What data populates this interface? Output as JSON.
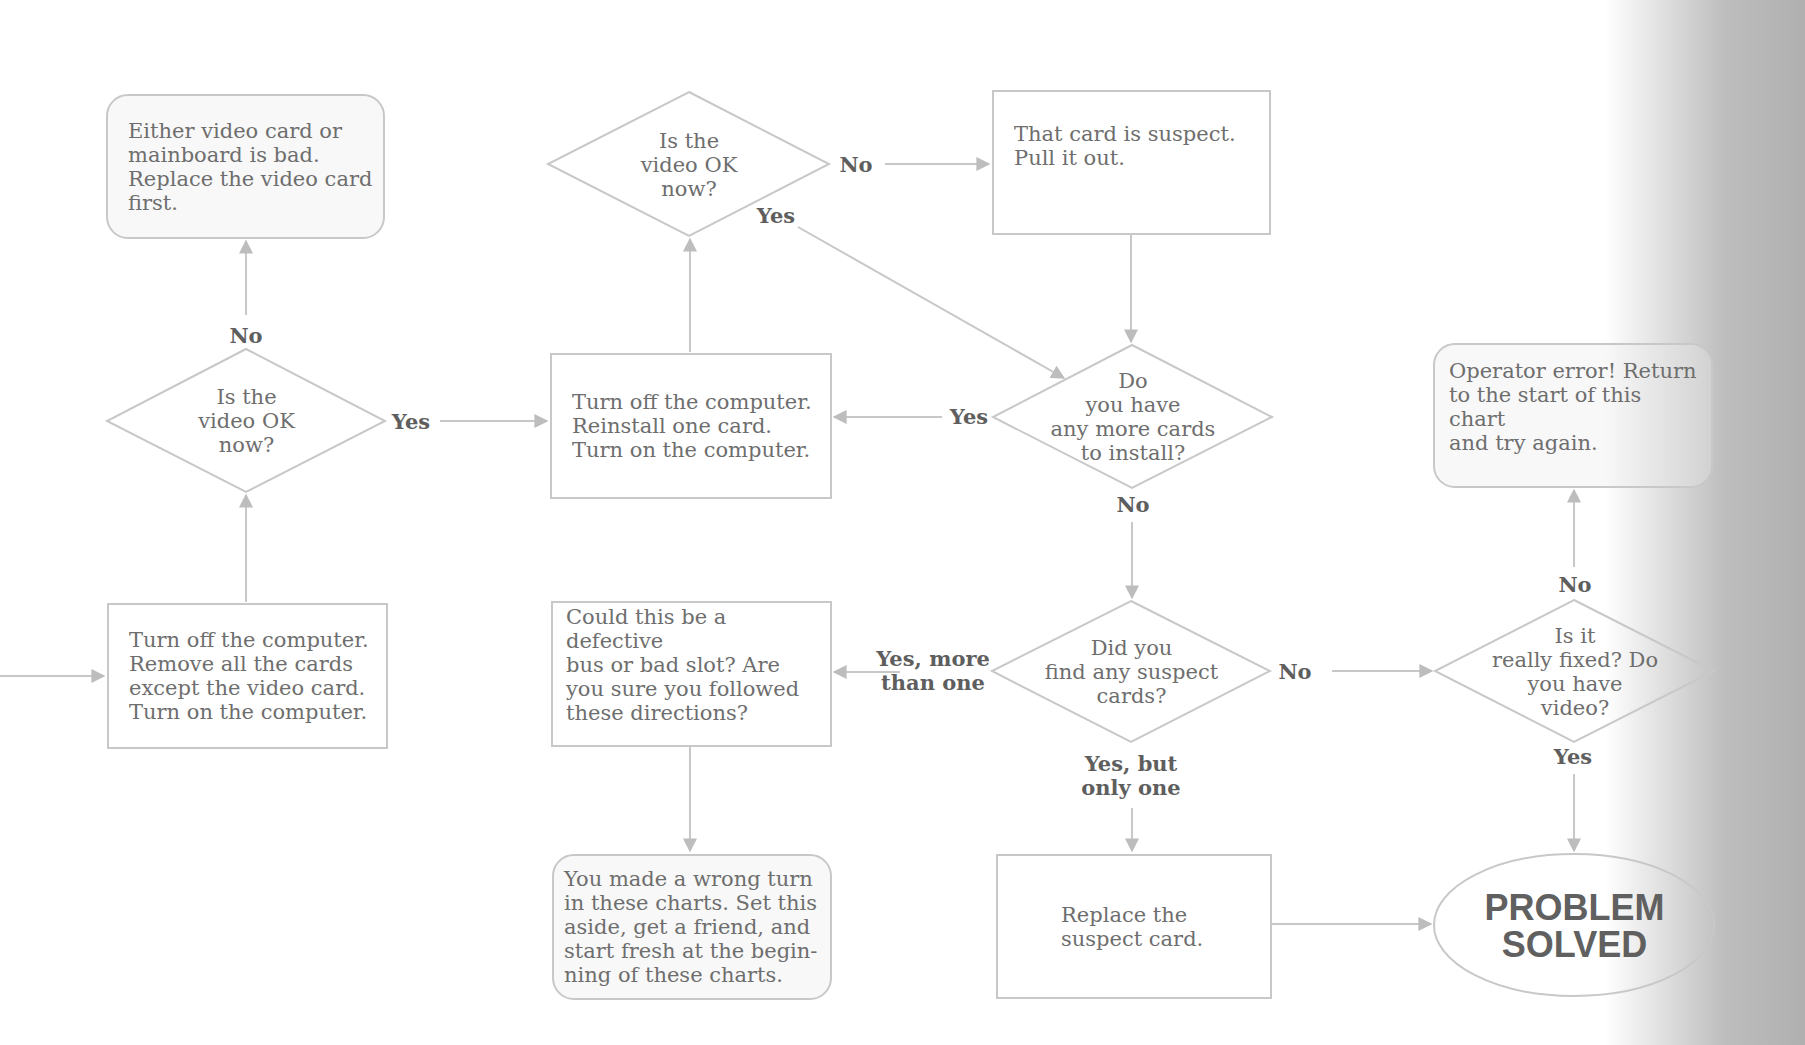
{
  "theme": {
    "line_color": "#c8c8c8",
    "arrow_color": "#bdbdbd",
    "text_color": "#6e6e6e",
    "label_color": "#5e5e5e"
  },
  "nodes": {
    "replace_video_card": {
      "type": "terminal-rounded",
      "text": "Either video card or\nmainboard is bad.\nReplace the video card\nfirst."
    },
    "video_ok_top": {
      "type": "decision",
      "text": "Is the\nvideo OK\nnow?"
    },
    "card_suspect": {
      "type": "process",
      "text": "That card is suspect.\nPull it out."
    },
    "video_ok_left": {
      "type": "decision",
      "text": "Is the\nvideo OK\nnow?"
    },
    "reinstall_card": {
      "type": "process",
      "text": "Turn off the computer.\nReinstall one card.\nTurn on the computer."
    },
    "more_cards": {
      "type": "decision",
      "text": "Do\nyou have\nany more cards\nto install?"
    },
    "operator_error": {
      "type": "terminal-rounded",
      "text": "Operator error!  Return\nto the start of this chart\nand try again."
    },
    "remove_cards": {
      "type": "process",
      "text": "Turn off the computer.\nRemove all the cards\nexcept the video card.\nTurn on the computer."
    },
    "defective_bus": {
      "type": "process",
      "text": "Could this be a defective\nbus or bad slot?  Are\nyou sure you followed\nthese directions?"
    },
    "found_suspect": {
      "type": "decision",
      "text": "Did you\nfind any suspect\ncards?"
    },
    "really_fixed": {
      "type": "decision",
      "text": "Is it\nreally fixed?  Do\nyou have\nvideo?"
    },
    "wrong_turn": {
      "type": "terminal-rounded",
      "text": "You made a wrong turn\nin these charts.  Set this\naside, get a friend, and\nstart fresh at the begin-\nning of these charts."
    },
    "replace_suspect": {
      "type": "process",
      "text": "Replace the\nsuspect card."
    },
    "problem_solved": {
      "type": "terminal-ellipse",
      "text": "PROBLEM\nSOLVED"
    }
  },
  "labels": {
    "left_no": "No",
    "left_yes": "Yes",
    "top_no": "No",
    "top_yes": "Yes",
    "more_cards_yes": "Yes",
    "more_cards_no": "No",
    "found_more_than_one": "Yes, more\nthan one",
    "found_no": "No",
    "found_only_one": "Yes, but\nonly one",
    "fixed_no": "No",
    "fixed_yes": "Yes"
  },
  "edges": [
    {
      "from": "entry",
      "to": "remove_cards",
      "label": ""
    },
    {
      "from": "remove_cards",
      "to": "video_ok_left",
      "label": ""
    },
    {
      "from": "video_ok_left",
      "to": "replace_video_card",
      "label": "No"
    },
    {
      "from": "video_ok_left",
      "to": "reinstall_card",
      "label": "Yes"
    },
    {
      "from": "reinstall_card",
      "to": "video_ok_top",
      "label": ""
    },
    {
      "from": "video_ok_top",
      "to": "card_suspect",
      "label": "No"
    },
    {
      "from": "video_ok_top",
      "to": "more_cards",
      "label": "Yes"
    },
    {
      "from": "card_suspect",
      "to": "more_cards",
      "label": ""
    },
    {
      "from": "more_cards",
      "to": "reinstall_card",
      "label": "Yes"
    },
    {
      "from": "more_cards",
      "to": "found_suspect",
      "label": "No"
    },
    {
      "from": "found_suspect",
      "to": "defective_bus",
      "label": "Yes, more than one"
    },
    {
      "from": "found_suspect",
      "to": "really_fixed",
      "label": "No"
    },
    {
      "from": "found_suspect",
      "to": "replace_suspect",
      "label": "Yes, but only one"
    },
    {
      "from": "defective_bus",
      "to": "wrong_turn",
      "label": ""
    },
    {
      "from": "replace_suspect",
      "to": "problem_solved",
      "label": ""
    },
    {
      "from": "really_fixed",
      "to": "operator_error",
      "label": "No"
    },
    {
      "from": "really_fixed",
      "to": "problem_solved",
      "label": "Yes"
    }
  ]
}
